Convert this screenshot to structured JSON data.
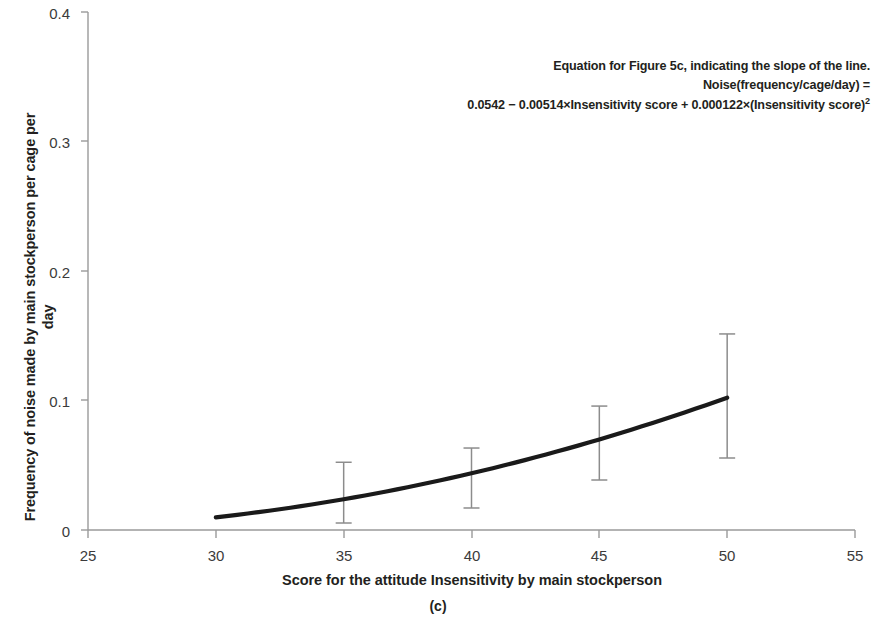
{
  "figure": {
    "panel_caption": "(c)",
    "y_axis_title_line1": "Frequency of noise made by main stockperson per cage per",
    "y_axis_title_line2": "day",
    "x_axis_title": "Score for the attitude Insensitivity by main stockperson",
    "annotation": {
      "line1": "Equation for Figure 5c, indicating the slope of the line.",
      "line2": "Noise(frequency/cage/day) =",
      "line3_a": "0.0542 ",
      "line3_b": "−",
      "line3_c": " 0.00514×Insensitivity score + 0.000122×(Insensitivity score)",
      "line3_sup": "2"
    }
  },
  "chart_data": {
    "type": "line",
    "title": "",
    "subtitle": "(c)",
    "xlabel": "Score for the attitude Insensitivity by main stockperson",
    "ylabel": "Frequency of noise made by main stockperson per cage per day",
    "xlim": [
      25,
      55
    ],
    "ylim": [
      0,
      0.4
    ],
    "xticks": [
      25,
      30,
      35,
      40,
      45,
      50,
      55
    ],
    "xtick_labels": [
      "25",
      "30",
      "35",
      "40",
      "45",
      "50",
      "55"
    ],
    "yticks": [
      0,
      0.1,
      0.2,
      0.3,
      0.4
    ],
    "ytick_labels": [
      "0",
      "0.1",
      "0.2",
      "0.3",
      "0.4"
    ],
    "grid": false,
    "legend": "none",
    "equation": "Noise(frequency/cage/day) = 0.0542 − 0.00514×Insensitivity score + 0.000122×(Insensitivity score)^2",
    "curve": {
      "name": "Fitted quadratic",
      "color": "#1a1a1a",
      "x_start": 30,
      "x_end": 50,
      "coefficients": {
        "intercept": 0.0542,
        "linear": -0.00514,
        "quadratic": 0.000122
      },
      "points": [
        {
          "x": 30,
          "y": 0.0107
        },
        {
          "x": 32,
          "y": 0.0151
        },
        {
          "x": 34,
          "y": 0.0201
        },
        {
          "x": 35,
          "y": 0.0237
        },
        {
          "x": 36,
          "y": 0.0258
        },
        {
          "x": 38,
          "y": 0.0345
        },
        {
          "x": 40,
          "y": 0.0438
        },
        {
          "x": 42,
          "y": 0.0557
        },
        {
          "x": 44,
          "y": 0.0676
        },
        {
          "x": 45,
          "y": 0.0709
        },
        {
          "x": 46,
          "y": 0.0803
        },
        {
          "x": 48,
          "y": 0.0929
        },
        {
          "x": 50,
          "y": 0.0982
        }
      ]
    },
    "error_bars": [
      {
        "x": 35,
        "mean": 0.0237,
        "lower": 0.0054,
        "upper": 0.0523
      },
      {
        "x": 40,
        "mean": 0.0438,
        "lower": 0.017,
        "upper": 0.0633
      },
      {
        "x": 45,
        "mean": 0.0709,
        "lower": 0.0386,
        "upper": 0.0957
      },
      {
        "x": 50,
        "mean": 0.0982,
        "lower": 0.0556,
        "upper": 0.1514
      }
    ]
  }
}
